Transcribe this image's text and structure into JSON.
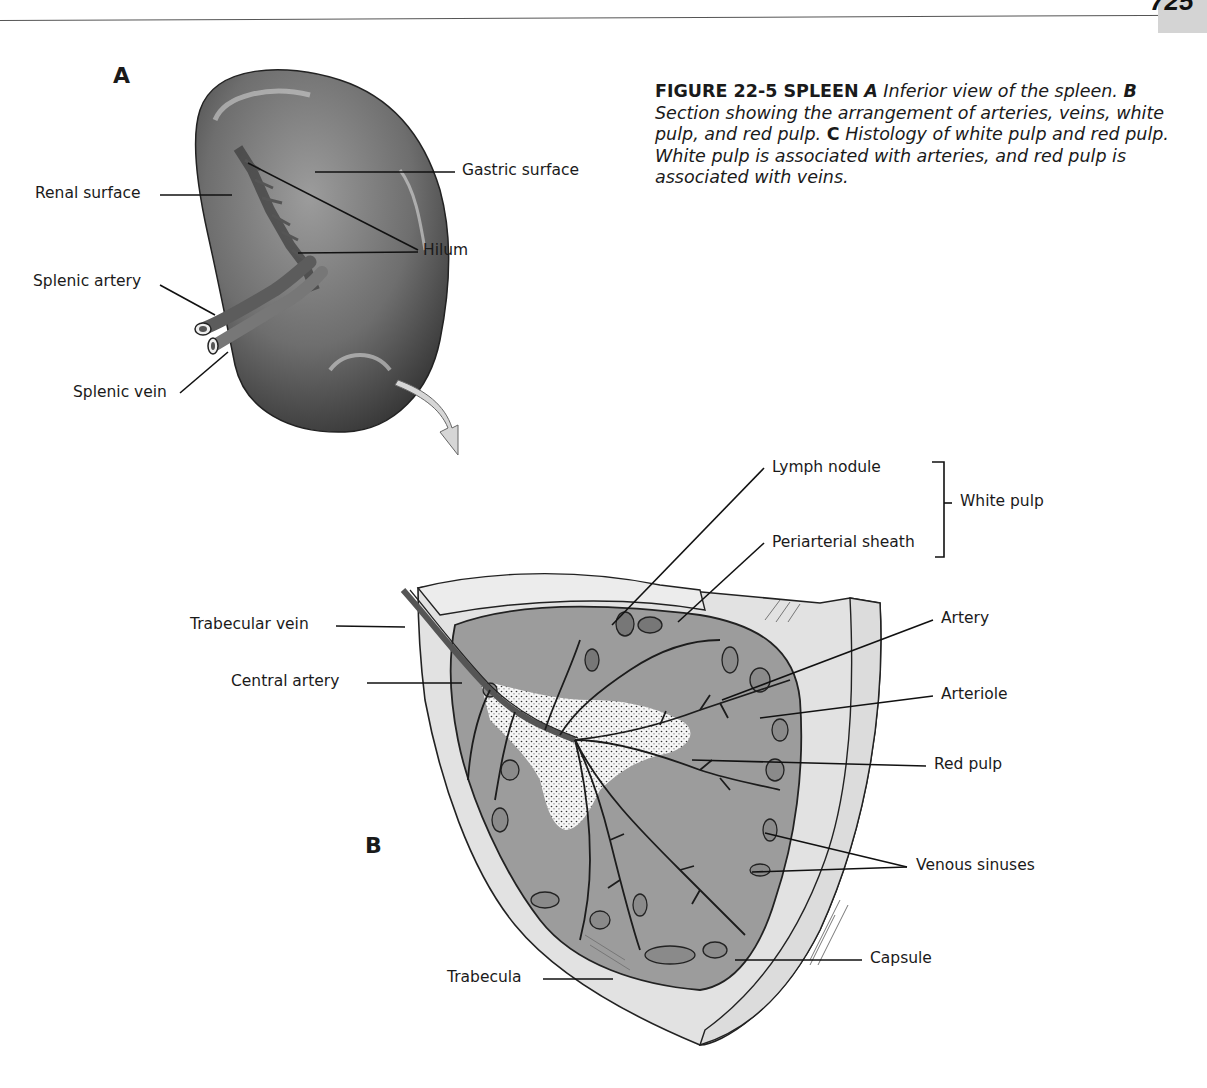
{
  "page": {
    "page_number": "725",
    "header_text_cut": ""
  },
  "caption": {
    "figure_label": "FIGURE 22-5 SPLEEN",
    "a_marker": "A",
    "a_text": " Inferior view of the spleen.",
    "b_marker": "B",
    "b_text": " Section showing the arrangement of arteries, veins, white pulp, and red pulp.",
    "c_marker": "C",
    "c_text": " Histology of white pulp and red pulp. White pulp is associated with arteries, and red pulp is associated with veins."
  },
  "panel_a": {
    "letter": "A",
    "labels": {
      "gastric_surface": "Gastric surface",
      "renal_surface": "Renal surface",
      "hilum": "Hilum",
      "splenic_artery": "Splenic artery",
      "splenic_vein": "Splenic vein"
    }
  },
  "panel_b": {
    "letter": "B",
    "labels": {
      "lymph_nodule": "Lymph nodule",
      "white_pulp": "White pulp",
      "periarterial_sheath": "Periarterial sheath",
      "trabecular_vein": "Trabecular vein",
      "central_artery": "Central artery",
      "artery": "Artery",
      "arteriole": "Arteriole",
      "red_pulp": "Red pulp",
      "venous_sinuses": "Venous sinuses",
      "capsule": "Capsule",
      "trabecula": "Trabecula"
    }
  },
  "colors": {
    "spleen_dark": "#3a3a3a",
    "spleen_mid": "#7a7a7a",
    "red_pulp_fill": "#9a9a9a",
    "capsule_fill": "#e2e2e2",
    "white_pulp_fill": "#f4f4f4",
    "page_tab": "#d4d4d4"
  }
}
